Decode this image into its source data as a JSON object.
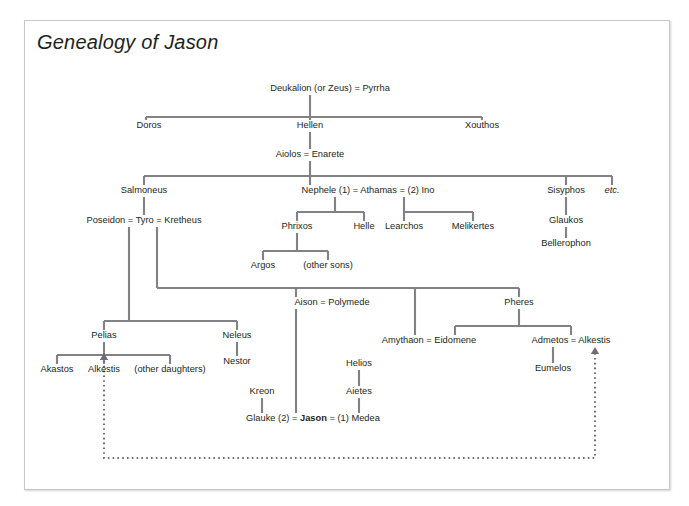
{
  "figure": {
    "title": "Genealogy of Jason",
    "line_color": "#808285",
    "text_color": "#231f20",
    "border_color": "#c8c8c8",
    "background": "#ffffff"
  },
  "chart_data": {
    "type": "diagram",
    "subtype": "genealogy-tree",
    "title": "Genealogy of Jason",
    "nodes": [
      {
        "id": "deukalion",
        "text": "Deukalion (or Zeus) = Pyrrha",
        "x": 305,
        "y": 68,
        "anchor": "middle"
      },
      {
        "id": "doros",
        "text": "Doros",
        "x": 124,
        "y": 105,
        "anchor": "middle"
      },
      {
        "id": "hellen",
        "text": "Hellen",
        "x": 285,
        "y": 105,
        "anchor": "middle"
      },
      {
        "id": "xouthos",
        "text": "Xouthos",
        "x": 457,
        "y": 105,
        "anchor": "middle"
      },
      {
        "id": "aiolos",
        "text": "Aiolos = Enarete",
        "x": 285,
        "y": 134,
        "anchor": "middle"
      },
      {
        "id": "salmoneus",
        "text": "Salmoneus",
        "x": 119,
        "y": 170,
        "anchor": "middle"
      },
      {
        "id": "nephele",
        "text": "Nephele (1) = Athamas = (2) Ino",
        "x": 343,
        "y": 170,
        "anchor": "middle"
      },
      {
        "id": "sisyphos",
        "text": "Sisyphos",
        "x": 541,
        "y": 170,
        "anchor": "middle"
      },
      {
        "id": "etc",
        "text": "etc.",
        "x": 587,
        "y": 170,
        "anchor": "middle",
        "italic": true
      },
      {
        "id": "poseidon",
        "text": "Poseidon = Tyro = Kretheus",
        "x": 119,
        "y": 200,
        "anchor": "middle"
      },
      {
        "id": "phrixos",
        "text": "Phrixos",
        "x": 272,
        "y": 206,
        "anchor": "middle"
      },
      {
        "id": "helle",
        "text": "Helle",
        "x": 339,
        "y": 206,
        "anchor": "middle"
      },
      {
        "id": "learchos",
        "text": "Learchos",
        "x": 379,
        "y": 206,
        "anchor": "middle"
      },
      {
        "id": "melikertes",
        "text": "Melikertes",
        "x": 448,
        "y": 206,
        "anchor": "middle"
      },
      {
        "id": "glaukos",
        "text": "Glaukos",
        "x": 541,
        "y": 200,
        "anchor": "middle"
      },
      {
        "id": "argos",
        "text": "Argos",
        "x": 238,
        "y": 245,
        "anchor": "middle"
      },
      {
        "id": "other_sons",
        "text": "(other sons)",
        "x": 303,
        "y": 245,
        "anchor": "middle"
      },
      {
        "id": "bellerophon",
        "text": "Bellerophon",
        "x": 541,
        "y": 223,
        "anchor": "middle"
      },
      {
        "id": "aison",
        "text": "Aison = Polymede",
        "x": 307,
        "y": 282,
        "anchor": "middle"
      },
      {
        "id": "pheres",
        "text": "Pheres",
        "x": 494,
        "y": 282,
        "anchor": "middle"
      },
      {
        "id": "amythaon",
        "text": "Amythaon = Eidomene",
        "x": 404,
        "y": 320,
        "anchor": "middle"
      },
      {
        "id": "admetos",
        "text": "Admetos = Alkestis",
        "x": 546,
        "y": 320,
        "anchor": "middle"
      },
      {
        "id": "pelias",
        "text": "Pelias",
        "x": 79,
        "y": 315,
        "anchor": "middle"
      },
      {
        "id": "neleus",
        "text": "Neleus",
        "x": 212,
        "y": 315,
        "anchor": "middle"
      },
      {
        "id": "nestor",
        "text": "Nestor",
        "x": 212,
        "y": 341,
        "anchor": "middle"
      },
      {
        "id": "akastos",
        "text": "Akastos",
        "x": 32,
        "y": 349,
        "anchor": "middle"
      },
      {
        "id": "alkestis",
        "text": "Alkestis",
        "x": 79,
        "y": 349,
        "anchor": "middle"
      },
      {
        "id": "other_daus",
        "text": "(other daughters)",
        "x": 145,
        "y": 349,
        "anchor": "middle"
      },
      {
        "id": "eumelos",
        "text": "Eumelos",
        "x": 528,
        "y": 348,
        "anchor": "middle"
      },
      {
        "id": "helios",
        "text": "Helios",
        "x": 334,
        "y": 343,
        "anchor": "middle"
      },
      {
        "id": "aietes",
        "text": "Aietes",
        "x": 334,
        "y": 371,
        "anchor": "middle"
      },
      {
        "id": "kreon",
        "text": "Kreon",
        "x": 237,
        "y": 371,
        "anchor": "middle"
      },
      {
        "id": "jason_row_a",
        "text": "Glauke (2) = ",
        "x": 221,
        "y": 398,
        "anchor": "start",
        "segments": [
          {
            "text": "Glauke (2) = ",
            "bold": false
          },
          {
            "text": "Jason",
            "bold": true
          },
          {
            "text": " = (1) Medea",
            "bold": false
          }
        ]
      }
    ],
    "edges": [
      {
        "id": "deukalion-stem",
        "d": "M 285 74 L 285 96"
      },
      {
        "id": "hellen-siblings-bar",
        "d": "M 121 96 L 457 96"
      },
      {
        "id": "doros-stub",
        "d": "M 121 96 L 121 98"
      },
      {
        "id": "doros-drop",
        "d": "M 121 96 L 121 99"
      },
      {
        "id": "xouthos-drop",
        "d": "M 457 96 L 457 99"
      },
      {
        "id": "hellen-drop",
        "d": "M 285 96 L 285 99"
      },
      {
        "id": "hellen-aiolos",
        "d": "M 285 111 L 285 128"
      },
      {
        "id": "aiolos-stem",
        "d": "M 285 140 L 285 155"
      },
      {
        "id": "aiolos-children-bar",
        "d": "M 119 155 L 587 155"
      },
      {
        "id": "salmoneus-drop",
        "d": "M 119 155 L 119 164"
      },
      {
        "id": "nephele-drop",
        "d": "M 285 155 L 285 164"
      },
      {
        "id": "sisyphos-drop",
        "d": "M 541 155 L 541 164"
      },
      {
        "id": "etc-drop",
        "d": "M 587 155 L 587 164"
      },
      {
        "id": "salmoneus-poseidon",
        "d": "M 119 176 L 119 194"
      },
      {
        "id": "athamas1-stem",
        "d": "M 310 176 L 310 191"
      },
      {
        "id": "athamas1-bar",
        "d": "M 272 191 L 339 191"
      },
      {
        "id": "phrixos-drop",
        "d": "M 272 191 L 272 200"
      },
      {
        "id": "helle-drop",
        "d": "M 339 191 L 339 200"
      },
      {
        "id": "athamas2-stem",
        "d": "M 379 176 L 379 191"
      },
      {
        "id": "athamas2-bar",
        "d": "M 379 191 L 448 191"
      },
      {
        "id": "learchos-drop",
        "d": "M 379 191 L 379 200"
      },
      {
        "id": "melikertes-drop",
        "d": "M 448 191 L 448 200"
      },
      {
        "id": "sisyphos-glaukos",
        "d": "M 541 176 L 541 194"
      },
      {
        "id": "glaukos-bellerophon",
        "d": "M 541 206 L 541 217"
      },
      {
        "id": "phrixos-stem",
        "d": "M 272 212 L 272 230"
      },
      {
        "id": "phrixos-bar",
        "d": "M 238 230 L 303 230"
      },
      {
        "id": "argos-drop",
        "d": "M 238 230 L 238 239"
      },
      {
        "id": "other-sons-drop",
        "d": "M 303 230 L 303 239"
      },
      {
        "id": "kretheus-long",
        "d": "M 132 206 L 132 267"
      },
      {
        "id": "kretheus-children-bar",
        "d": "M 132 267 L 494 267"
      },
      {
        "id": "aison-drop",
        "d": "M 271 267 L 271 276"
      },
      {
        "id": "amythaon-drop",
        "d": "M 390 267 L 390 314"
      },
      {
        "id": "pheres-drop",
        "d": "M 494 267 L 494 276"
      },
      {
        "id": "poseidon-long",
        "d": "M 104 206 L 104 300"
      },
      {
        "id": "pelias-neleus-bar",
        "d": "M 79 300 L 212 300"
      },
      {
        "id": "pelias-drop",
        "d": "M 79 300 L 79 309"
      },
      {
        "id": "neleus-drop",
        "d": "M 212 300 L 212 309"
      },
      {
        "id": "neleus-nestor",
        "d": "M 212 321 L 212 335"
      },
      {
        "id": "pelias-stem",
        "d": "M 79 321 L 79 334"
      },
      {
        "id": "pelias-children-bar",
        "d": "M 32 334 L 145 334"
      },
      {
        "id": "akastos-drop",
        "d": "M 32 334 L 32 343"
      },
      {
        "id": "alkestis-drop",
        "d": "M 79 334 L 79 343"
      },
      {
        "id": "other-daus-drop",
        "d": "M 145 334 L 145 343"
      },
      {
        "id": "pheres-stem",
        "d": "M 494 288 L 494 305"
      },
      {
        "id": "pheres-children-bar",
        "d": "M 430 305 L 546 305"
      },
      {
        "id": "amythaon-pheres-drop",
        "d": "M 430 305 L 430 314"
      },
      {
        "id": "admetos-drop",
        "d": "M 546 305 L 546 314"
      },
      {
        "id": "admetos-eumelos",
        "d": "M 528 326 L 528 342"
      },
      {
        "id": "aison-jason",
        "d": "M 271 288 L 271 392"
      },
      {
        "id": "helios-aietes",
        "d": "M 334 349 L 334 365"
      },
      {
        "id": "aietes-medea",
        "d": "M 334 377 L 334 392"
      },
      {
        "id": "kreon-glauke",
        "d": "M 237 377 L 237 392"
      }
    ],
    "dotted_edges": [
      {
        "id": "alkestis-link",
        "d": "M 79 340 L 79 437 L 570 437 L 570 330",
        "arrow_start": {
          "x": 79,
          "y": 332,
          "dir": "up"
        },
        "arrow_end": {
          "x": 570,
          "y": 326,
          "dir": "up"
        }
      }
    ]
  }
}
